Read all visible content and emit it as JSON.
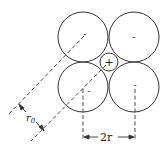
{
  "diagram": {
    "type": "ionic-packing-square",
    "anions": [
      {
        "id": "top-left",
        "charge": "-",
        "cx": 83,
        "cy": 37,
        "r": 25
      },
      {
        "id": "top-right",
        "charge": "-",
        "cx": 134,
        "cy": 37,
        "r": 25
      },
      {
        "id": "bottom-left",
        "charge": "-",
        "cx": 83,
        "cy": 87,
        "r": 25
      },
      {
        "id": "bottom-right",
        "charge": "-",
        "cx": 134,
        "cy": 87,
        "r": 25
      }
    ],
    "cation": {
      "charge": "+",
      "cx": 109,
      "cy": 62,
      "r": 9
    },
    "labels": {
      "r0": "r",
      "r0_sub": "0",
      "two_r": "2r"
    },
    "colors": {
      "stroke": "#333333",
      "background": "#ffffff"
    }
  }
}
